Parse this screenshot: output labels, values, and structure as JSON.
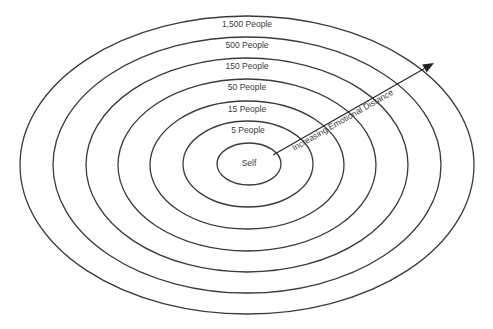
{
  "diagram": {
    "type": "concentric-ellipses",
    "rings": [
      {
        "label": "1,500 People",
        "cx": 247,
        "cy": 165,
        "rx": 227,
        "ry": 149,
        "label_y": 27
      },
      {
        "label": "500 People",
        "cx": 247,
        "cy": 165,
        "rx": 194,
        "ry": 128,
        "label_y": 48
      },
      {
        "label": "150 People",
        "cx": 247,
        "cy": 165,
        "rx": 161,
        "ry": 107,
        "label_y": 69
      },
      {
        "label": "50 People",
        "cx": 247,
        "cy": 165,
        "rx": 129,
        "ry": 86,
        "label_y": 90
      },
      {
        "label": "15 People",
        "cx": 247,
        "cy": 165,
        "rx": 97,
        "ry": 64,
        "label_y": 112
      },
      {
        "label": "5 People",
        "cx": 248,
        "cy": 164,
        "rx": 65,
        "ry": 43,
        "label_y": 133
      },
      {
        "label": "Self",
        "cx": 249,
        "cy": 164,
        "rx": 32,
        "ry": 21,
        "label_y": 166
      }
    ],
    "arrow": {
      "label": "Increasing Emotional Distance",
      "x1": 273,
      "y1": 155,
      "x2": 434,
      "y2": 63
    },
    "colors": {
      "stroke": "#3a3a3a",
      "text": "#3a3a3a",
      "background": "#ffffff"
    }
  }
}
